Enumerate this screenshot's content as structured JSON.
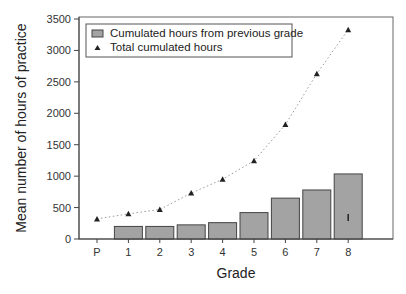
{
  "chart_data": {
    "type": "bar+line",
    "title": "",
    "xlabel": "Grade",
    "ylabel": "Mean number of hours of practice",
    "ylim": [
      0,
      3500
    ],
    "yticks": [
      0,
      500,
      1000,
      1500,
      2000,
      2500,
      3000,
      3500
    ],
    "categories": [
      "P",
      "1",
      "2",
      "3",
      "4",
      "5",
      "6",
      "7",
      "8"
    ],
    "series": [
      {
        "name": "Cumulated hours from previous grade",
        "kind": "bar",
        "values": [
          null,
          200,
          200,
          225,
          260,
          420,
          650,
          780,
          1035
        ]
      },
      {
        "name": "Total cumulated hours",
        "kind": "line-triangle-dotted",
        "values": [
          320,
          400,
          470,
          730,
          950,
          1245,
          1820,
          2630,
          3330
        ]
      }
    ],
    "legend_position": "upper-left",
    "grid": false,
    "colors": {
      "bar_fill": "#a3a3a3",
      "bar_edge": "#444444",
      "marker": "#222222",
      "line": "#9a9a9a",
      "axis": "#444444"
    }
  }
}
